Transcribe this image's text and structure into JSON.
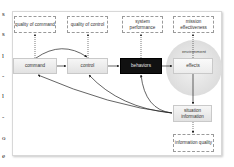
{
  "diagram": {
    "outcomes": [
      {
        "id": "quality-of-command",
        "label": "quality of command"
      },
      {
        "id": "quality-of-control",
        "label": "quality of control"
      },
      {
        "id": "system-performance",
        "label": "system performance"
      },
      {
        "id": "mission-effectiveness",
        "label": "mission effectiveness"
      }
    ],
    "processes": [
      {
        "id": "command",
        "label": "command"
      },
      {
        "id": "control",
        "label": "control"
      },
      {
        "id": "behaviors",
        "label": "behaviors"
      },
      {
        "id": "effects",
        "label": "effects"
      }
    ],
    "environment_label": "environment",
    "situation_information": "situation information",
    "information_quality": "information quality",
    "edges": [
      {
        "from": "command",
        "to": "control",
        "style": "solid"
      },
      {
        "from": "control",
        "to": "behaviors",
        "style": "solid"
      },
      {
        "from": "behaviors",
        "to": "effects",
        "style": "solid"
      },
      {
        "from": "effects",
        "to": "situation-information",
        "style": "solid"
      },
      {
        "from": "command",
        "to": "control",
        "style": "curved-over"
      },
      {
        "from": "situation-information",
        "to": "command",
        "style": "curved"
      },
      {
        "from": "situation-information",
        "to": "control",
        "style": "curved"
      },
      {
        "from": "situation-information",
        "to": "behaviors",
        "style": "curved"
      },
      {
        "from": "command",
        "to": "quality-of-command",
        "style": "dotted"
      },
      {
        "from": "control",
        "to": "quality-of-control",
        "style": "dotted"
      },
      {
        "from": "behaviors",
        "to": "system-performance",
        "style": "dotted"
      },
      {
        "from": "effects",
        "to": "mission-effectiveness",
        "style": "dotted"
      },
      {
        "from": "situation-information",
        "to": "information-quality",
        "style": "dotted"
      }
    ]
  },
  "side_text": [
    "s",
    "s",
    "l",
    "-",
    "l",
    "-",
    "o",
    "e"
  ]
}
